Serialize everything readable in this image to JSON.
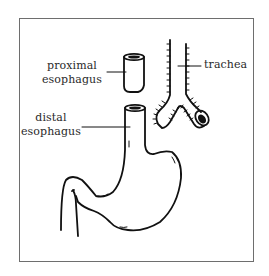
{
  "diagram": {
    "type": "anatomical illustration",
    "labels": {
      "proximal": [
        "proximal",
        "esophagus"
      ],
      "distal": [
        "distal",
        "esophagus"
      ],
      "trachea": "trachea"
    },
    "parts": [
      "proximal-esophagus-pouch",
      "distal-esophagus",
      "stomach",
      "duodenum",
      "trachea",
      "bronchi"
    ],
    "colors": {
      "stroke": "#111111",
      "frame": "#6e6e6e",
      "text": "#2a2a2a",
      "background": "#ffffff"
    }
  }
}
